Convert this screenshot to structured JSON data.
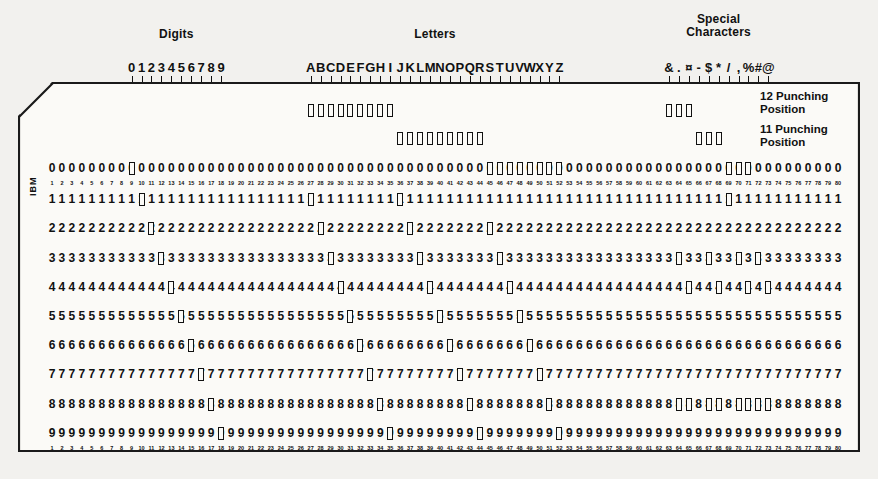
{
  "figure": {
    "columns_total": 80,
    "card_rows": [
      "12",
      "11",
      "0",
      "1",
      "2",
      "3",
      "4",
      "5",
      "6",
      "7",
      "8",
      "9"
    ],
    "printed_digit_rows": [
      "0",
      "1",
      "2",
      "3",
      "4",
      "5",
      "6",
      "7",
      "8",
      "9"
    ],
    "brand": "IBM",
    "ink_color": "#111111",
    "card_color": "#fbfaf7",
    "page_color": "#f2f1ee"
  },
  "groups": [
    {
      "name": "digits",
      "label": "Digits",
      "start_col": 9,
      "end_col": 18
    },
    {
      "name": "letters",
      "label": "Letters",
      "start_col": 27,
      "end_col": 52
    },
    {
      "name": "special-characters",
      "label": "Special\nCharacters",
      "start_col": 63,
      "end_col": 73
    }
  ],
  "punching_positions": [
    {
      "name": "12-punching-position",
      "label": "12 Punching\nPosition"
    },
    {
      "name": "11-punching-position",
      "label": "11 Punching\nPosition"
    }
  ],
  "column_numbers": [
    1,
    2,
    3,
    4,
    5,
    6,
    7,
    8,
    9,
    10,
    11,
    12,
    13,
    14,
    15,
    16,
    17,
    18,
    19,
    20,
    21,
    22,
    23,
    24,
    25,
    26,
    27,
    28,
    29,
    30,
    31,
    32,
    33,
    34,
    35,
    36,
    37,
    38,
    39,
    40,
    41,
    42,
    43,
    44,
    45,
    46,
    47,
    48,
    49,
    50,
    51,
    52,
    53,
    54,
    55,
    56,
    57,
    58,
    59,
    60,
    61,
    62,
    63,
    64,
    65,
    66,
    67,
    68,
    69,
    70,
    71,
    72,
    73,
    74,
    75,
    76,
    77,
    78,
    79,
    80
  ],
  "chart_data": {
    "type": "table",
    "xlabel": "Card column (1-80)",
    "ylabel": "Punch row (12, 11, 0, 1-9)",
    "row_order": [
      "12",
      "11",
      "0",
      "1",
      "2",
      "3",
      "4",
      "5",
      "6",
      "7",
      "8",
      "9"
    ],
    "legend": [
      "Digits",
      "Letters",
      "Special Characters"
    ],
    "punched_columns": [
      {
        "column": 9,
        "character": "0",
        "group": "digits",
        "rows": [
          "0"
        ]
      },
      {
        "column": 10,
        "character": "1",
        "group": "digits",
        "rows": [
          "1"
        ]
      },
      {
        "column": 11,
        "character": "2",
        "group": "digits",
        "rows": [
          "2"
        ]
      },
      {
        "column": 12,
        "character": "3",
        "group": "digits",
        "rows": [
          "3"
        ]
      },
      {
        "column": 13,
        "character": "4",
        "group": "digits",
        "rows": [
          "4"
        ]
      },
      {
        "column": 14,
        "character": "5",
        "group": "digits",
        "rows": [
          "5"
        ]
      },
      {
        "column": 15,
        "character": "6",
        "group": "digits",
        "rows": [
          "6"
        ]
      },
      {
        "column": 16,
        "character": "7",
        "group": "digits",
        "rows": [
          "7"
        ]
      },
      {
        "column": 17,
        "character": "8",
        "group": "digits",
        "rows": [
          "8"
        ]
      },
      {
        "column": 18,
        "character": "9",
        "group": "digits",
        "rows": [
          "9"
        ]
      },
      {
        "column": 27,
        "character": "A",
        "group": "letters",
        "rows": [
          "12",
          "1"
        ]
      },
      {
        "column": 28,
        "character": "B",
        "group": "letters",
        "rows": [
          "12",
          "2"
        ]
      },
      {
        "column": 29,
        "character": "C",
        "group": "letters",
        "rows": [
          "12",
          "3"
        ]
      },
      {
        "column": 30,
        "character": "D",
        "group": "letters",
        "rows": [
          "12",
          "4"
        ]
      },
      {
        "column": 31,
        "character": "E",
        "group": "letters",
        "rows": [
          "12",
          "5"
        ]
      },
      {
        "column": 32,
        "character": "F",
        "group": "letters",
        "rows": [
          "12",
          "6"
        ]
      },
      {
        "column": 33,
        "character": "G",
        "group": "letters",
        "rows": [
          "12",
          "7"
        ]
      },
      {
        "column": 34,
        "character": "H",
        "group": "letters",
        "rows": [
          "12",
          "8"
        ]
      },
      {
        "column": 35,
        "character": "I",
        "group": "letters",
        "rows": [
          "12",
          "9"
        ]
      },
      {
        "column": 36,
        "character": "J",
        "group": "letters",
        "rows": [
          "11",
          "1"
        ]
      },
      {
        "column": 37,
        "character": "K",
        "group": "letters",
        "rows": [
          "11",
          "2"
        ]
      },
      {
        "column": 38,
        "character": "L",
        "group": "letters",
        "rows": [
          "11",
          "3"
        ]
      },
      {
        "column": 39,
        "character": "M",
        "group": "letters",
        "rows": [
          "11",
          "4"
        ]
      },
      {
        "column": 40,
        "character": "N",
        "group": "letters",
        "rows": [
          "11",
          "5"
        ]
      },
      {
        "column": 41,
        "character": "O",
        "group": "letters",
        "rows": [
          "11",
          "6"
        ]
      },
      {
        "column": 42,
        "character": "P",
        "group": "letters",
        "rows": [
          "11",
          "7"
        ]
      },
      {
        "column": 43,
        "character": "Q",
        "group": "letters",
        "rows": [
          "11",
          "8"
        ]
      },
      {
        "column": 44,
        "character": "R",
        "group": "letters",
        "rows": [
          "11",
          "9"
        ]
      },
      {
        "column": 45,
        "character": "S",
        "group": "letters",
        "rows": [
          "0",
          "2"
        ]
      },
      {
        "column": 46,
        "character": "T",
        "group": "letters",
        "rows": [
          "0",
          "3"
        ]
      },
      {
        "column": 47,
        "character": "U",
        "group": "letters",
        "rows": [
          "0",
          "4"
        ]
      },
      {
        "column": 48,
        "character": "V",
        "group": "letters",
        "rows": [
          "0",
          "5"
        ]
      },
      {
        "column": 49,
        "character": "W",
        "group": "letters",
        "rows": [
          "0",
          "6"
        ]
      },
      {
        "column": 50,
        "character": "X",
        "group": "letters",
        "rows": [
          "0",
          "7"
        ]
      },
      {
        "column": 51,
        "character": "Y",
        "group": "letters",
        "rows": [
          "0",
          "8"
        ]
      },
      {
        "column": 52,
        "character": "Z",
        "group": "letters",
        "rows": [
          "0",
          "9"
        ]
      },
      {
        "column": 63,
        "character": "&",
        "group": "special-characters",
        "rows": [
          "12"
        ]
      },
      {
        "column": 64,
        "character": ".",
        "group": "special-characters",
        "rows": [
          "12",
          "3",
          "8"
        ]
      },
      {
        "column": 65,
        "character": "¤",
        "group": "special-characters",
        "rows": [
          "12",
          "4",
          "8"
        ]
      },
      {
        "column": 66,
        "character": "-",
        "group": "special-characters",
        "rows": [
          "11"
        ]
      },
      {
        "column": 67,
        "character": "$",
        "group": "special-characters",
        "rows": [
          "11",
          "3",
          "8"
        ]
      },
      {
        "column": 68,
        "character": "*",
        "group": "special-characters",
        "rows": [
          "11",
          "4",
          "8"
        ]
      },
      {
        "column": 69,
        "character": "/",
        "group": "special-characters",
        "rows": [
          "0",
          "1"
        ]
      },
      {
        "column": 70,
        "character": ",",
        "group": "special-characters",
        "rows": [
          "0",
          "3",
          "8"
        ]
      },
      {
        "column": 71,
        "character": "%",
        "group": "special-characters",
        "rows": [
          "0",
          "4",
          "8"
        ]
      },
      {
        "column": 72,
        "character": "#",
        "group": "special-characters",
        "rows": [
          "3",
          "8"
        ]
      },
      {
        "column": 73,
        "character": "@",
        "group": "special-characters",
        "rows": [
          "4",
          "8"
        ]
      }
    ]
  }
}
